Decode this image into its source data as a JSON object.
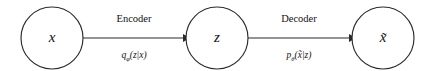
{
  "diagram": {
    "type": "variational-autoencoder-flow",
    "background_color": "#ffffff",
    "stroke_color": "#2b2b2b",
    "text_color": "#111111",
    "nodes": [
      {
        "id": "input",
        "label": "x",
        "cx": 52,
        "cy": 38,
        "r": 31
      },
      {
        "id": "latent",
        "label": "z",
        "cx": 217,
        "cy": 38,
        "r": 31
      },
      {
        "id": "reconstruction",
        "label": "x̃",
        "cx": 383,
        "cy": 38,
        "r": 31
      }
    ],
    "edges": [
      {
        "id": "encoder",
        "title": "Encoder",
        "formula_base": "q",
        "formula_subscript": "φ",
        "formula_rest": "(z|x)",
        "formula_full": "q_φ(z|x)",
        "from": "input",
        "to": "latent",
        "x1": 83,
        "x2": 186,
        "y": 38,
        "label_x": 134,
        "title_y": 22,
        "formula_y": 58
      },
      {
        "id": "decoder",
        "title": "Decoder",
        "formula_base": "p",
        "formula_subscript": "θ",
        "formula_rest": "(x̃|z)",
        "formula_full": "p_θ(x̃|z)",
        "from": "latent",
        "to": "reconstruction",
        "x1": 248,
        "x2": 352,
        "y": 38,
        "label_x": 299,
        "title_y": 22,
        "formula_y": 58
      }
    ]
  }
}
